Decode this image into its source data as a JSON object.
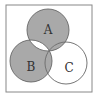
{
  "diagram": {
    "type": "venn",
    "sets": [
      {
        "name": "A",
        "cx": 48,
        "cy": 30,
        "r": 21
      },
      {
        "name": "B",
        "cx": 31,
        "cy": 61,
        "r": 21
      },
      {
        "name": "C",
        "cx": 66,
        "cy": 63,
        "r": 21
      }
    ],
    "shaded_regions": [
      "A only",
      "B only",
      "A∩C only",
      "B∩C only"
    ],
    "unshaded_regions": [
      "C only",
      "A∩B only",
      "A∩B∩C"
    ],
    "labels": {
      "a": "A",
      "b": "B",
      "c": "C"
    },
    "colors": {
      "shade": "#a9a9a9",
      "stroke": "#666666",
      "background": "#ffffff"
    }
  }
}
